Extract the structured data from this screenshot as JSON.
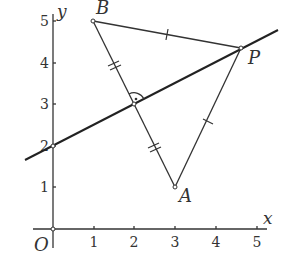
{
  "diagram": {
    "type": "coordinate-geometry",
    "axes": {
      "x_label": "x",
      "y_label": "y",
      "origin_label": "O",
      "x_ticks": [
        "1",
        "2",
        "3",
        "4",
        "5"
      ],
      "y_ticks": [
        "1",
        "2",
        "3",
        "4",
        "5"
      ]
    },
    "points": {
      "A": {
        "label": "A",
        "x": 3,
        "y": 1
      },
      "B": {
        "label": "B",
        "x": 1,
        "y": 5
      },
      "P": {
        "label": "P",
        "x": 4.67,
        "y": 4.33
      },
      "M": {
        "label": "",
        "x": 2,
        "y": 3
      },
      "Y2": {
        "label": "",
        "x": 0,
        "y": 2
      }
    },
    "segments": [
      {
        "from": "A",
        "to": "B",
        "marks": "double tick at each half (BM = MA)"
      },
      {
        "from": "B",
        "to": "P",
        "marks": "single tick"
      },
      {
        "from": "A",
        "to": "P",
        "marks": "single tick"
      }
    ],
    "lines": [
      {
        "name": "perpendicular bisector of AB",
        "through": [
          "Y2",
          "M",
          "P"
        ],
        "equation": "y = x/2 + 2"
      }
    ],
    "annotations": [
      "right-angle arc with dot at M"
    ]
  }
}
